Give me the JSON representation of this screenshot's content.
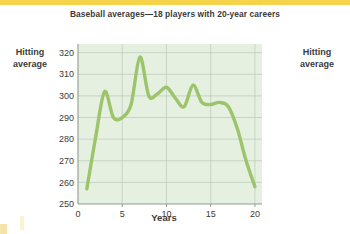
{
  "figure": {
    "title": "Baseball averages—18 players with 20-year careers",
    "left_axis_label_line1": "Hitting",
    "left_axis_label_line2": "average",
    "right_axis_label_line1": "Hitting",
    "right_axis_label_line2": "average",
    "colors": {
      "line": "#9cc46a",
      "plot_background": "#e6f0e0",
      "grid": "#b9c9b9",
      "axis": "#8f9b8f",
      "text": "#3b3b3b",
      "top_strip": "#f5d34a",
      "page_background": "#ffffff"
    }
  },
  "chart_data": {
    "type": "line",
    "title": "Baseball averages—18 players with 20-year careers",
    "xlabel": "Years",
    "ylabel": "Hitting average",
    "xlim": [
      0,
      20.8
    ],
    "ylim": [
      250,
      324
    ],
    "grid": true,
    "legend": "none",
    "xticks": [
      0,
      5,
      10,
      15,
      20
    ],
    "xtick_labels": [
      "0",
      "5",
      "10",
      "15",
      "20"
    ],
    "yticks": [
      250,
      260,
      270,
      280,
      290,
      300,
      310,
      320
    ],
    "ytick_labels": [
      "250",
      "260",
      "270",
      "280",
      "290",
      "300",
      "310",
      "320"
    ],
    "series": [
      {
        "name": "Hitting average",
        "x": [
          1,
          2,
          3,
          4,
          5,
          6,
          7,
          8,
          9,
          10,
          11,
          12,
          13,
          14,
          15,
          16,
          17,
          18,
          19,
          20
        ],
        "values": [
          257,
          281,
          302,
          290,
          290,
          296,
          318,
          300,
          301,
          304,
          299,
          295,
          305,
          297,
          296,
          297,
          295,
          285,
          270,
          258
        ]
      }
    ]
  },
  "xaxis": {
    "title": "Years",
    "tick_labels": [
      "0",
      "5",
      "10",
      "15",
      "20"
    ]
  },
  "yaxis": {
    "tick_labels": [
      "320",
      "310",
      "300",
      "290",
      "280",
      "270",
      "260",
      "250"
    ]
  }
}
